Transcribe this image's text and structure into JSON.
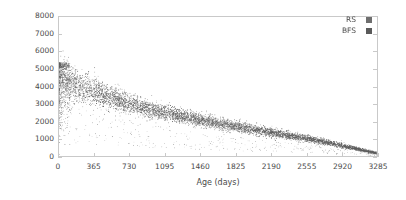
{
  "chart_data": {
    "type": "scatter",
    "title": "",
    "xlabel": "Age (days)",
    "ylabel": "Videos per day",
    "xlim": [
      0,
      3285
    ],
    "ylim": [
      0,
      8000
    ],
    "xticks": [
      0,
      365,
      730,
      1095,
      1460,
      1825,
      2190,
      2555,
      2920,
      3285
    ],
    "yticks": [
      0,
      1000,
      2000,
      3000,
      4000,
      5000,
      6000,
      7000,
      8000
    ],
    "xtick_labels": [
      "0",
      "365",
      "730",
      "1095",
      "1460",
      "1825",
      "2190",
      "2555",
      "2920",
      "3285"
    ],
    "ytick_labels": [
      "0",
      "1000",
      "2000",
      "3000",
      "4000",
      "5000",
      "6000",
      "7000",
      "8000"
    ],
    "grid": false,
    "legend_position": "top-right",
    "series": [
      {
        "name": "RS",
        "color": "#6e6e6e",
        "marker": "square",
        "marker_size": 1,
        "description": "Dense scatter cloud of videos-per-day versus video age; decays from roughly 4000-5300 at age 0 to under 300 near age 3285.",
        "trend_x": [
          0,
          60,
          120,
          180,
          240,
          300,
          365,
          500,
          640,
          730,
          900,
          1095,
          1280,
          1460,
          1640,
          1825,
          2010,
          2190,
          2370,
          2555,
          2740,
          2920,
          3100,
          3285
        ],
        "trend_y": [
          4450,
          4350,
          4200,
          4050,
          3900,
          3800,
          3700,
          3450,
          3150,
          2980,
          2720,
          2480,
          2260,
          2060,
          1880,
          1700,
          1530,
          1360,
          1190,
          1010,
          820,
          610,
          390,
          170
        ],
        "spread_x": [
          0,
          120,
          240,
          365,
          500,
          730,
          1095,
          1460,
          1825,
          2190,
          2555,
          2920,
          3285
        ],
        "spread_y": [
          950,
          880,
          800,
          720,
          620,
          500,
          400,
          330,
          275,
          225,
          175,
          120,
          60
        ],
        "n_points_approx": 3300
      },
      {
        "name": "BFS",
        "color": "#5a5a5a",
        "marker": "square",
        "marker_size": 1,
        "description": "Overlapping scatter cloud following the same decaying trend as RS, largely indistinguishable at this scale.",
        "trend_x": [
          0,
          60,
          120,
          180,
          240,
          300,
          365,
          500,
          640,
          730,
          900,
          1095,
          1280,
          1460,
          1640,
          1825,
          2010,
          2190,
          2370,
          2555,
          2740,
          2920,
          3100,
          3285
        ],
        "trend_y": [
          4500,
          4380,
          4250,
          4100,
          3960,
          3850,
          3750,
          3500,
          3200,
          3020,
          2760,
          2520,
          2300,
          2100,
          1910,
          1730,
          1560,
          1390,
          1210,
          1030,
          840,
          630,
          400,
          180
        ],
        "spread_x": [
          0,
          120,
          240,
          365,
          500,
          730,
          1095,
          1460,
          1825,
          2190,
          2555,
          2920,
          3285
        ],
        "spread_y": [
          980,
          900,
          820,
          740,
          640,
          520,
          410,
          340,
          285,
          230,
          180,
          125,
          65
        ],
        "n_points_approx": 3300
      }
    ],
    "annotations": [
      {
        "text": "Vertical spike of high-variance points near age 0 reaching about 5300 videos per day",
        "x": 0,
        "y": 5300
      }
    ]
  },
  "legend": {
    "items": [
      {
        "label": "RS",
        "swatch_color": "#6e6e6e"
      },
      {
        "label": "BFS",
        "swatch_color": "#5a5a5a"
      }
    ]
  },
  "axes": {
    "frame_color": "#c9c9c9",
    "tick_color": "#c9c9c9",
    "text_color": "#4a4a4a"
  },
  "figure": {
    "background": "#ffffff"
  }
}
